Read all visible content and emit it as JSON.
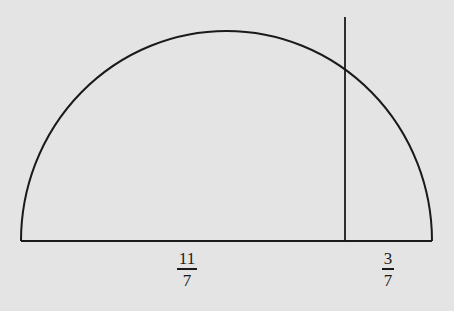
{
  "figure": {
    "shape": "semicircle",
    "stroke_color": "#1a1a1a",
    "background": "#e4e4e4",
    "labels": {
      "left_segment": {
        "numerator": "11",
        "denominator": "7"
      },
      "right_segment": {
        "numerator": "3",
        "denominator": "7"
      }
    }
  }
}
